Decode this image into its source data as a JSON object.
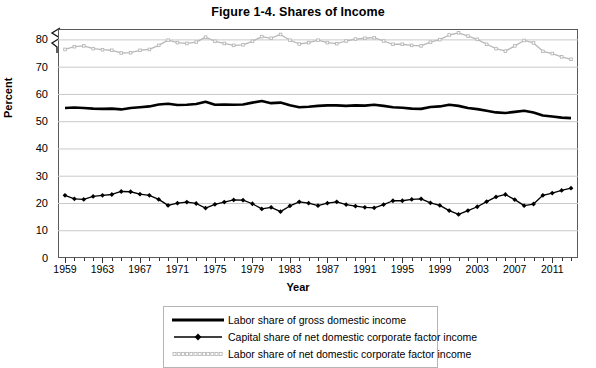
{
  "figure": {
    "title": "Figure 1-4. Shares of Income"
  },
  "axes": {
    "y_title": "Percent",
    "x_title": "Year",
    "y_ticks": [
      "0",
      "10",
      "20",
      "30",
      "40",
      "50",
      "60",
      "70",
      "80"
    ],
    "x_ticks": [
      "1959",
      "1963",
      "1967",
      "1971",
      "1975",
      "1979",
      "1983",
      "1987",
      "1991",
      "1995",
      "1999",
      "2003",
      "2007",
      "2011"
    ],
    "axis_break": "y-axis-break-zigzag"
  },
  "legend": {
    "items": [
      {
        "label": "Labor share of gross domestic income",
        "style": "thick-solid-black",
        "color": "#000000"
      },
      {
        "label": "Capital share of net domestic corporate factor income",
        "style": "thin-solid-black-diamond-markers",
        "color": "#000000"
      },
      {
        "label": "Labor share of net domestic corporate factor income",
        "style": "light-gray-beaded",
        "color": "#b8b8b8"
      }
    ]
  },
  "chart_data": {
    "type": "line",
    "title": "Figure 1-4. Shares of Income",
    "xlabel": "Year",
    "ylabel": "Percent",
    "xlim": [
      1959,
      2013
    ],
    "ylim": [
      0,
      84
    ],
    "grid": true,
    "legend_position": "below-plot",
    "x": [
      1959,
      1960,
      1961,
      1962,
      1963,
      1964,
      1965,
      1966,
      1967,
      1968,
      1969,
      1970,
      1971,
      1972,
      1973,
      1974,
      1975,
      1976,
      1977,
      1978,
      1979,
      1980,
      1981,
      1982,
      1983,
      1984,
      1985,
      1986,
      1987,
      1988,
      1989,
      1990,
      1991,
      1992,
      1993,
      1994,
      1995,
      1996,
      1997,
      1998,
      1999,
      2000,
      2001,
      2002,
      2003,
      2004,
      2005,
      2006,
      2007,
      2008,
      2009,
      2010,
      2011,
      2012,
      2013
    ],
    "series": [
      {
        "name": "Labor share of gross domestic income",
        "color": "#000000",
        "values": [
          55.0,
          55.2,
          55.0,
          54.8,
          54.7,
          54.8,
          54.5,
          55.0,
          55.3,
          55.6,
          56.3,
          56.6,
          56.1,
          56.2,
          56.5,
          57.3,
          56.2,
          56.3,
          56.2,
          56.3,
          57.0,
          57.6,
          56.8,
          57.0,
          56.0,
          55.3,
          55.5,
          55.8,
          56.0,
          56.0,
          55.8,
          56.0,
          55.9,
          56.2,
          55.8,
          55.3,
          55.1,
          54.8,
          54.7,
          55.4,
          55.6,
          56.2,
          55.8,
          55.0,
          54.6,
          54.0,
          53.4,
          53.2,
          53.6,
          54.0,
          53.4,
          52.3,
          51.9,
          51.5,
          51.3
        ]
      },
      {
        "name": "Capital share of net domestic corporate factor income",
        "color": "#000000",
        "values": [
          23.0,
          21.7,
          21.5,
          22.6,
          23.0,
          23.3,
          24.4,
          24.3,
          23.4,
          23.0,
          21.5,
          19.3,
          20.1,
          20.5,
          20.0,
          18.3,
          19.7,
          20.5,
          21.3,
          21.2,
          19.9,
          18.0,
          18.6,
          17.0,
          19.1,
          20.6,
          20.1,
          19.2,
          20.1,
          20.6,
          19.6,
          19.0,
          18.6,
          18.4,
          19.6,
          21.0,
          21.0,
          21.5,
          21.7,
          20.2,
          19.3,
          17.4,
          16.0,
          17.4,
          18.8,
          20.7,
          22.4,
          23.3,
          21.4,
          19.2,
          19.8,
          23.0,
          23.8,
          24.8,
          25.6
        ]
      },
      {
        "name": "Labor share of net domestic corporate factor income",
        "color": "#b8b8b8",
        "values": [
          76.5,
          77.5,
          77.8,
          76.8,
          76.4,
          76.2,
          75.2,
          75.3,
          76.2,
          76.5,
          78.0,
          79.9,
          79.0,
          78.7,
          79.2,
          81.0,
          79.5,
          78.7,
          78.0,
          78.2,
          79.5,
          81.2,
          80.6,
          82.0,
          79.9,
          78.5,
          79.0,
          79.9,
          79.0,
          78.6,
          79.6,
          80.3,
          80.6,
          80.8,
          79.6,
          78.4,
          78.4,
          78.0,
          77.8,
          79.2,
          80.1,
          81.8,
          82.6,
          81.4,
          80.2,
          78.4,
          76.8,
          75.9,
          77.8,
          79.8,
          78.9,
          75.8,
          75.0,
          73.8,
          72.9
        ]
      }
    ]
  }
}
